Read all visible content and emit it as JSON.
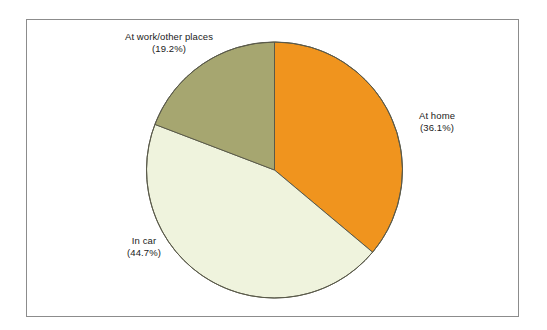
{
  "chart_data": {
    "type": "pie",
    "title": "",
    "subtitle": "",
    "xlabel": "",
    "ylabel": "",
    "legend_position": "none",
    "grid": false,
    "label_format": "name + (percent%)",
    "start_angle_deg_from_12oclock": 0,
    "direction": "clockwise",
    "categories": [
      "At home",
      "In car",
      "At work/other places"
    ],
    "values": [
      36.1,
      44.7,
      19.2
    ],
    "units": "percent",
    "slices": [
      {
        "name": "At home",
        "percent": 36.1,
        "value_label": "(36.1%)",
        "color": "#F0941E",
        "start_deg": 0,
        "end_deg": 129.96
      },
      {
        "name": "In car",
        "percent": 44.7,
        "value_label": "(44.7%)",
        "color": "#EFF3DD",
        "start_deg": 129.96,
        "end_deg": 290.88
      },
      {
        "name": "At work/other places",
        "percent": 19.2,
        "value_label": "(19.2%)",
        "color": "#A6A670",
        "start_deg": 290.88,
        "end_deg": 360
      }
    ]
  },
  "figure": {
    "frame_color": "#8c8c8c",
    "background": "#ffffff",
    "pie_outline_color": "#5a5a4a"
  },
  "labels": {
    "at_work": {
      "name": "At work/other places",
      "value": "(19.2%)"
    },
    "at_home": {
      "name": "At home",
      "value": "(36.1%)"
    },
    "in_car": {
      "name": "In car",
      "value": "(44.7%)"
    }
  }
}
